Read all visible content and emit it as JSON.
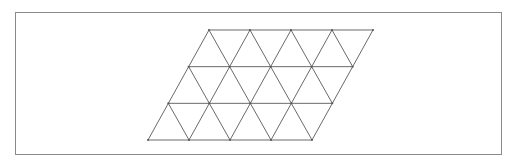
{
  "diagram": {
    "type": "triangular-grid-parallelogram",
    "rows": 3,
    "units_per_row": 4,
    "origin_bottom_left": [
      148,
      140
    ],
    "unit_width": 41,
    "row_height": 36.67,
    "row_shift": 20.33,
    "colors": {
      "line": "#6a6a6a",
      "frame": "#8a8a8a",
      "vertex": "#555555",
      "background": "#ffffff"
    }
  }
}
